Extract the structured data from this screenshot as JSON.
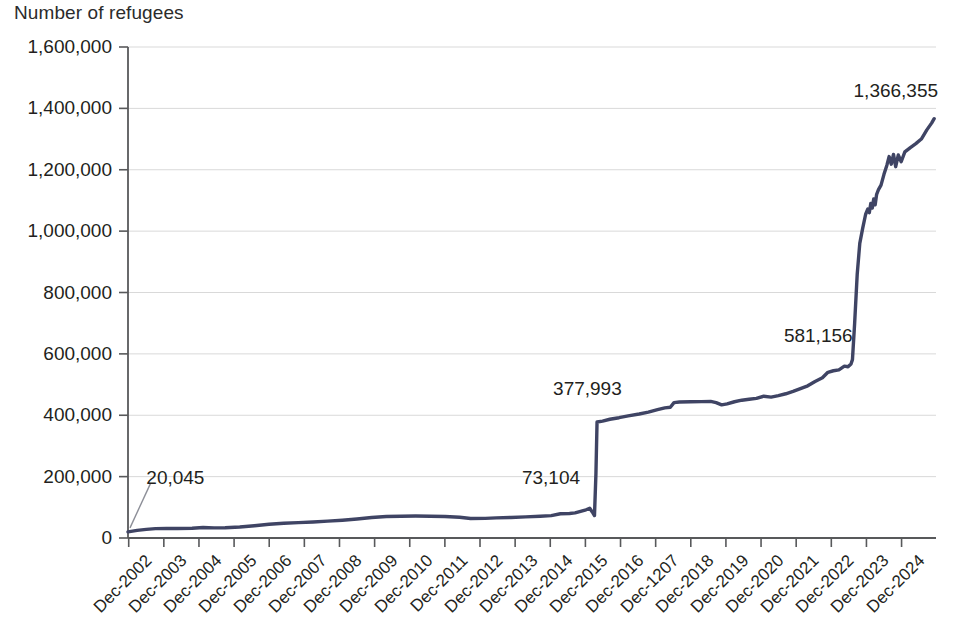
{
  "chart_data": {
    "type": "line",
    "title": "",
    "ylabel": "Number of refugees",
    "xlabel": "",
    "ylim": [
      0,
      1600000
    ],
    "grid": true,
    "legend": "none",
    "line_color": "#3f4464",
    "gridline_color": "#d9d9d9",
    "axis_color": "#58595b",
    "ytick_labels": [
      "0",
      "200,000",
      "400,000",
      "600,000",
      "800,000",
      "1,000,000",
      "1,200,000",
      "1,400,000",
      "1,600,000"
    ],
    "ytick_values": [
      0,
      200000,
      400000,
      600000,
      800000,
      1000000,
      1200000,
      1400000,
      1600000
    ],
    "categories": [
      "Dec-2002",
      "Dec-2003",
      "Dec-2004",
      "Dec-2005",
      "Dec-2006",
      "Dec-2007",
      "Dec-2008",
      "Dec-2009",
      "Dec-2010",
      "Dec-2011",
      "Dec-2012",
      "Dec-2013",
      "Dec-2014",
      "Dec-2015",
      "Dec-2016",
      "Dec-1207",
      "Dec-2018",
      "Dec-2019",
      "Dec-2020",
      "Dec-2021",
      "Dec-2022",
      "Dec-2023",
      "Dec-2024"
    ],
    "x_start": 2002.95,
    "x_end": 2025.0,
    "annotations": [
      {
        "text": "20,045",
        "x": 2002.95,
        "y": 20045,
        "label_x": 2003.45,
        "label_y": 196000,
        "leader": true
      },
      {
        "text": "73,104",
        "x": 2015.55,
        "y": 73104,
        "label_x": 2013.7,
        "label_y": 196000,
        "leader": false
      },
      {
        "text": "377,993",
        "x": 2015.75,
        "y": 377993,
        "label_x": 2014.55,
        "label_y": 487000,
        "leader": false
      },
      {
        "text": "581,156",
        "x": 2022.7,
        "y": 581156,
        "label_x": 2020.85,
        "label_y": 658000,
        "leader": false
      },
      {
        "text": "1,366,355",
        "x": 2024.95,
        "y": 1366355,
        "label_x": 2022.75,
        "label_y": 1455000,
        "leader": false
      }
    ],
    "series": [
      {
        "name": "Number of refugees",
        "points": [
          [
            2002.95,
            20045
          ],
          [
            2003.2,
            25000
          ],
          [
            2003.45,
            28000
          ],
          [
            2003.7,
            30500
          ],
          [
            2004.0,
            31500
          ],
          [
            2004.3,
            31000
          ],
          [
            2004.7,
            32000
          ],
          [
            2005.0,
            34000
          ],
          [
            2005.3,
            33000
          ],
          [
            2005.6,
            33500
          ],
          [
            2006.0,
            36000
          ],
          [
            2006.4,
            40000
          ],
          [
            2006.8,
            45000
          ],
          [
            2007.2,
            48000
          ],
          [
            2007.6,
            50000
          ],
          [
            2008.0,
            52000
          ],
          [
            2008.4,
            55000
          ],
          [
            2008.8,
            58000
          ],
          [
            2009.2,
            62000
          ],
          [
            2009.6,
            67000
          ],
          [
            2010.0,
            70000
          ],
          [
            2010.4,
            71000
          ],
          [
            2010.8,
            71500
          ],
          [
            2011.2,
            71000
          ],
          [
            2011.6,
            70000
          ],
          [
            2012.0,
            67500
          ],
          [
            2012.3,
            63500
          ],
          [
            2012.7,
            64000
          ],
          [
            2013.0,
            65500
          ],
          [
            2013.4,
            67000
          ],
          [
            2013.8,
            69000
          ],
          [
            2014.2,
            71000
          ],
          [
            2014.5,
            73000
          ],
          [
            2014.75,
            79000
          ],
          [
            2015.0,
            80000
          ],
          [
            2015.15,
            82000
          ],
          [
            2015.3,
            87000
          ],
          [
            2015.45,
            92000
          ],
          [
            2015.55,
            97000
          ],
          [
            2015.62,
            85000
          ],
          [
            2015.68,
            73104
          ],
          [
            2015.72,
            210000
          ],
          [
            2015.75,
            377993
          ],
          [
            2015.9,
            381000
          ],
          [
            2016.1,
            387000
          ],
          [
            2016.35,
            392000
          ],
          [
            2016.6,
            398000
          ],
          [
            2016.9,
            404000
          ],
          [
            2017.15,
            410000
          ],
          [
            2017.4,
            418000
          ],
          [
            2017.6,
            424000
          ],
          [
            2017.75,
            426000
          ],
          [
            2017.85,
            441000
          ],
          [
            2018.0,
            443000
          ],
          [
            2018.3,
            444000
          ],
          [
            2018.6,
            444500
          ],
          [
            2018.85,
            445000
          ],
          [
            2019.0,
            441000
          ],
          [
            2019.15,
            434000
          ],
          [
            2019.3,
            437000
          ],
          [
            2019.5,
            444000
          ],
          [
            2019.7,
            449000
          ],
          [
            2019.9,
            452000
          ],
          [
            2020.1,
            455000
          ],
          [
            2020.3,
            462000
          ],
          [
            2020.5,
            459000
          ],
          [
            2020.7,
            464000
          ],
          [
            2020.9,
            470000
          ],
          [
            2021.1,
            478000
          ],
          [
            2021.3,
            487000
          ],
          [
            2021.5,
            496000
          ],
          [
            2021.7,
            510000
          ],
          [
            2021.9,
            522000
          ],
          [
            2022.05,
            540000
          ],
          [
            2022.2,
            545000
          ],
          [
            2022.35,
            548000
          ],
          [
            2022.5,
            560000
          ],
          [
            2022.6,
            558000
          ],
          [
            2022.68,
            567000
          ],
          [
            2022.72,
            581156
          ],
          [
            2022.78,
            700000
          ],
          [
            2022.85,
            860000
          ],
          [
            2022.92,
            960000
          ],
          [
            2023.0,
            1010000
          ],
          [
            2023.08,
            1055000
          ],
          [
            2023.14,
            1072000
          ],
          [
            2023.18,
            1060000
          ],
          [
            2023.22,
            1090000
          ],
          [
            2023.26,
            1075000
          ],
          [
            2023.3,
            1105000
          ],
          [
            2023.34,
            1086000
          ],
          [
            2023.38,
            1120000
          ],
          [
            2023.43,
            1135000
          ],
          [
            2023.5,
            1150000
          ],
          [
            2023.58,
            1185000
          ],
          [
            2023.66,
            1215000
          ],
          [
            2023.72,
            1243000
          ],
          [
            2023.78,
            1218000
          ],
          [
            2023.84,
            1250000
          ],
          [
            2023.9,
            1210000
          ],
          [
            2023.97,
            1248000
          ],
          [
            2024.05,
            1226000
          ],
          [
            2024.15,
            1258000
          ],
          [
            2024.3,
            1272000
          ],
          [
            2024.45,
            1285000
          ],
          [
            2024.6,
            1300000
          ],
          [
            2024.75,
            1330000
          ],
          [
            2024.88,
            1352000
          ],
          [
            2024.95,
            1366355
          ]
        ]
      }
    ]
  }
}
